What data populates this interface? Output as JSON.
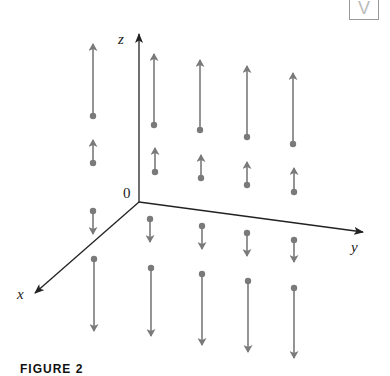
{
  "figure": {
    "caption": "FIGURE 2",
    "badge_icon": "V-badge",
    "badge_text": "V",
    "axes": {
      "origin_label": "0",
      "x_label": "x",
      "y_label": "y",
      "z_label": "z",
      "origin": [
        139,
        202
      ],
      "x_end": [
        35,
        293
      ],
      "y_end": [
        363,
        232
      ],
      "z_end": [
        139,
        34
      ]
    },
    "colors": {
      "axis": "#222222",
      "vector": "#7a7a7a"
    },
    "vector_field": "F(x, y, z) = z k",
    "vectors": [
      {
        "base": [
          93,
          116
        ],
        "tip": [
          93,
          44
        ]
      },
      {
        "base": [
          154,
          125
        ],
        "tip": [
          154,
          54
        ]
      },
      {
        "base": [
          200,
          130
        ],
        "tip": [
          200,
          60
        ]
      },
      {
        "base": [
          247,
          137
        ],
        "tip": [
          247,
          66
        ]
      },
      {
        "base": [
          293,
          144
        ],
        "tip": [
          293,
          73
        ]
      },
      {
        "base": [
          93,
          163
        ],
        "tip": [
          93,
          140
        ]
      },
      {
        "base": [
          155,
          172
        ],
        "tip": [
          155,
          148
        ]
      },
      {
        "base": [
          201,
          178
        ],
        "tip": [
          201,
          155
        ]
      },
      {
        "base": [
          247,
          185
        ],
        "tip": [
          247,
          162
        ]
      },
      {
        "base": [
          294,
          192
        ],
        "tip": [
          294,
          168
        ]
      },
      {
        "base": [
          93,
          211
        ],
        "tip": [
          93,
          234
        ]
      },
      {
        "base": [
          150,
          219
        ],
        "tip": [
          150,
          242
        ]
      },
      {
        "base": [
          202,
          226
        ],
        "tip": [
          202,
          249
        ]
      },
      {
        "base": [
          247,
          233
        ],
        "tip": [
          247,
          256
        ]
      },
      {
        "base": [
          294,
          240
        ],
        "tip": [
          294,
          262
        ]
      },
      {
        "base": [
          94,
          259
        ],
        "tip": [
          94,
          331
        ]
      },
      {
        "base": [
          151,
          268
        ],
        "tip": [
          151,
          336
        ]
      },
      {
        "base": [
          202,
          274
        ],
        "tip": [
          202,
          345
        ]
      },
      {
        "base": [
          248,
          281
        ],
        "tip": [
          248,
          352
        ]
      },
      {
        "base": [
          294,
          288
        ],
        "tip": [
          294,
          358
        ]
      }
    ]
  }
}
